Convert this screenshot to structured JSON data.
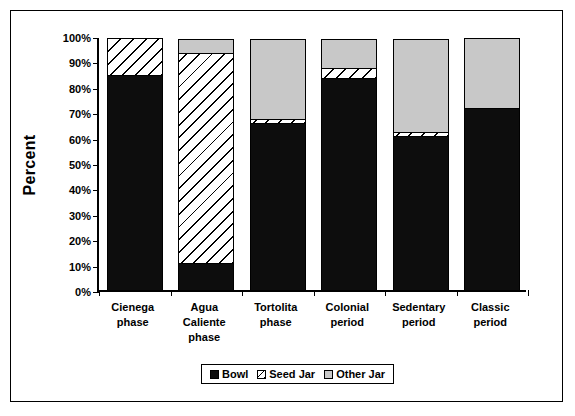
{
  "chart_data": {
    "type": "bar",
    "subtype": "stacked-100-percent",
    "title": "",
    "xlabel": "",
    "ylabel": "Percent",
    "ylim": [
      0,
      100
    ],
    "ytick_labels": [
      "100%",
      "90%",
      "80%",
      "70%",
      "60%",
      "50%",
      "40%",
      "30%",
      "20%",
      "10%",
      "0%"
    ],
    "ytick_values": [
      100,
      90,
      80,
      70,
      60,
      50,
      40,
      30,
      20,
      10,
      0
    ],
    "grid": false,
    "legend_position": "bottom",
    "categories": [
      "Cienega phase",
      "Agua Caliente phase",
      "Tortolita phase",
      "Colonial period",
      "Sedentary period",
      "Classic period"
    ],
    "category_lines": [
      [
        "Cienega",
        "phase"
      ],
      [
        "Agua",
        "Caliente",
        "phase"
      ],
      [
        "Tortolita",
        "phase"
      ],
      [
        "Colonial",
        "period"
      ],
      [
        "Sedentary",
        "period"
      ],
      [
        "Classic",
        "period"
      ]
    ],
    "series": [
      {
        "name": "Bowl",
        "color": "#0d0d0d",
        "pattern": "solid-black",
        "values": [
          85,
          11,
          66,
          84,
          61,
          72
        ]
      },
      {
        "name": "Seed Jar",
        "color": "#ffffff",
        "pattern": "diagonal-hatch",
        "values": [
          15,
          83,
          2,
          4,
          2,
          0
        ]
      },
      {
        "name": "Other Jar",
        "color": "#c8c8c8",
        "pattern": "solid-gray",
        "values": [
          0,
          6,
          32,
          12,
          37,
          28
        ]
      }
    ]
  },
  "legend": {
    "items": [
      {
        "label": "Bowl"
      },
      {
        "label": "Seed Jar"
      },
      {
        "label": "Other Jar"
      }
    ]
  },
  "axis": {
    "y_title": "Percent"
  },
  "colors": {
    "bowl": "#0d0d0d",
    "seed_jar": "#ffffff",
    "other_jar": "#c8c8c8",
    "axis": "#000000",
    "background": "#ffffff"
  }
}
